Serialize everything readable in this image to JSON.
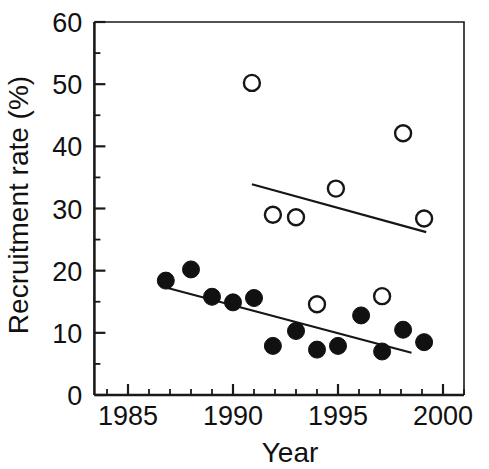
{
  "chart_data": {
    "type": "scatter",
    "title": "",
    "xlabel": "Year",
    "ylabel": "Recruitment rate (%)",
    "xlim": [
      1983.4,
      2001.0
    ],
    "ylim": [
      0,
      60
    ],
    "xticks": [
      1985,
      1990,
      1995,
      2000
    ],
    "xtick_labels": [
      "1985",
      "1990",
      "1995",
      "2000"
    ],
    "xtick_minor_step": 1,
    "yticks": [
      0,
      10,
      20,
      30,
      40,
      50,
      60
    ],
    "ytick_labels": [
      "0",
      "10",
      "20",
      "30",
      "40",
      "50",
      "60"
    ],
    "ytick_minor_step": 5,
    "grid": false,
    "legend": "none",
    "series": [
      {
        "name": "filled-circles",
        "marker": "filled-circle",
        "marker_color": "#111111",
        "points": [
          {
            "x": 1986.8,
            "y": 18.4
          },
          {
            "x": 1988.0,
            "y": 20.2
          },
          {
            "x": 1989.0,
            "y": 15.8
          },
          {
            "x": 1990.0,
            "y": 14.9
          },
          {
            "x": 1991.0,
            "y": 15.6
          },
          {
            "x": 1991.9,
            "y": 7.9
          },
          {
            "x": 1993.0,
            "y": 10.3
          },
          {
            "x": 1994.0,
            "y": 7.3
          },
          {
            "x": 1995.0,
            "y": 7.9
          },
          {
            "x": 1996.1,
            "y": 12.8
          },
          {
            "x": 1997.1,
            "y": 7.0
          },
          {
            "x": 1998.1,
            "y": 10.5
          },
          {
            "x": 1999.1,
            "y": 8.5
          }
        ]
      },
      {
        "name": "open-circles",
        "marker": "open-circle",
        "marker_color": "#ffffff",
        "points": [
          {
            "x": 1990.9,
            "y": 50.2
          },
          {
            "x": 1991.9,
            "y": 29.0
          },
          {
            "x": 1993.0,
            "y": 28.6
          },
          {
            "x": 1994.0,
            "y": 14.6
          },
          {
            "x": 1994.9,
            "y": 33.2
          },
          {
            "x": 1997.1,
            "y": 15.9
          },
          {
            "x": 1998.1,
            "y": 42.1
          },
          {
            "x": 1999.1,
            "y": 28.4
          }
        ]
      }
    ],
    "trend_lines": [
      {
        "name": "open-circle-trend",
        "x0": 1990.9,
        "y0": 33.9,
        "x1": 1999.2,
        "y1": 26.2
      },
      {
        "name": "filled-circle-trend",
        "x0": 1986.8,
        "y0": 17.3,
        "x1": 1998.5,
        "y1": 6.8
      }
    ]
  }
}
